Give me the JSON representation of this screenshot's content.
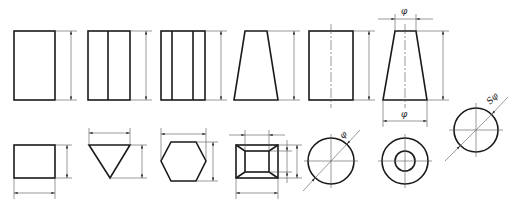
{
  "diagram": {
    "labels": {
      "diameter": "φ",
      "sphere_diameter": "Sφ"
    },
    "colors": {
      "object_line": "#1a1a1a",
      "dimension_line": "#555555",
      "background": "#ffffff"
    },
    "top_row": [
      {
        "name": "square-prism-front-view",
        "dims": [
          "height"
        ]
      },
      {
        "name": "two-face-prism-front-view",
        "dims": [
          "height"
        ]
      },
      {
        "name": "three-face-prism-front-view",
        "dims": [
          "height"
        ]
      },
      {
        "name": "frustum-front-view",
        "dims": [
          "height"
        ]
      },
      {
        "name": "cylinder-front-view",
        "dims": [
          "height"
        ]
      },
      {
        "name": "cone-frustum-front-view",
        "dims": [
          "top-diameter φ",
          "bottom-diameter φ",
          "height"
        ]
      },
      {
        "name": "sphere-view",
        "dims": [
          "sphere-diameter Sφ"
        ]
      }
    ],
    "bottom_row": [
      {
        "name": "rectangle-top-view",
        "dims": [
          "width",
          "depth"
        ]
      },
      {
        "name": "triangle-top-view",
        "dims": [
          "width",
          "height"
        ]
      },
      {
        "name": "hexagon-top-view",
        "dims": [
          "width",
          "height"
        ]
      },
      {
        "name": "pyramid-frustum-top-view",
        "dims": [
          "inner-width",
          "outer-width",
          "inner-depth",
          "outer-depth"
        ]
      },
      {
        "name": "cylinder-top-view",
        "dims": [
          "diameter φ"
        ]
      },
      {
        "name": "hollow-cone-top-view",
        "dims": []
      }
    ]
  }
}
